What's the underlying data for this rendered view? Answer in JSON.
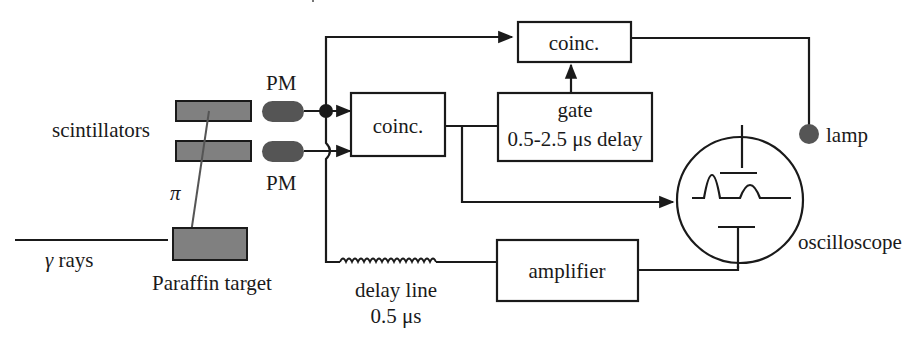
{
  "diagram": {
    "title_fragment": "",
    "labels": {
      "scintillators": "scintillators",
      "pm_top": "PM",
      "pm_bottom": "PM",
      "pion": "π",
      "gamma_rays": "γ rays",
      "paraffin_target": "Paraffin target",
      "coinc_main": "coinc.",
      "coinc_top": "coinc.",
      "gate_line1": "gate",
      "gate_line2": "0.5-2.5 μs delay",
      "lamp": "lamp",
      "oscilloscope": "oscilloscope",
      "delay_line_line1": "delay line",
      "delay_line_line2": "0.5 μs",
      "amplifier": "amplifier"
    },
    "colors": {
      "line": "#1a1a1a",
      "scintillator_fill": "#808080",
      "pm_fill": "#555555",
      "lamp_fill": "#555555"
    }
  }
}
